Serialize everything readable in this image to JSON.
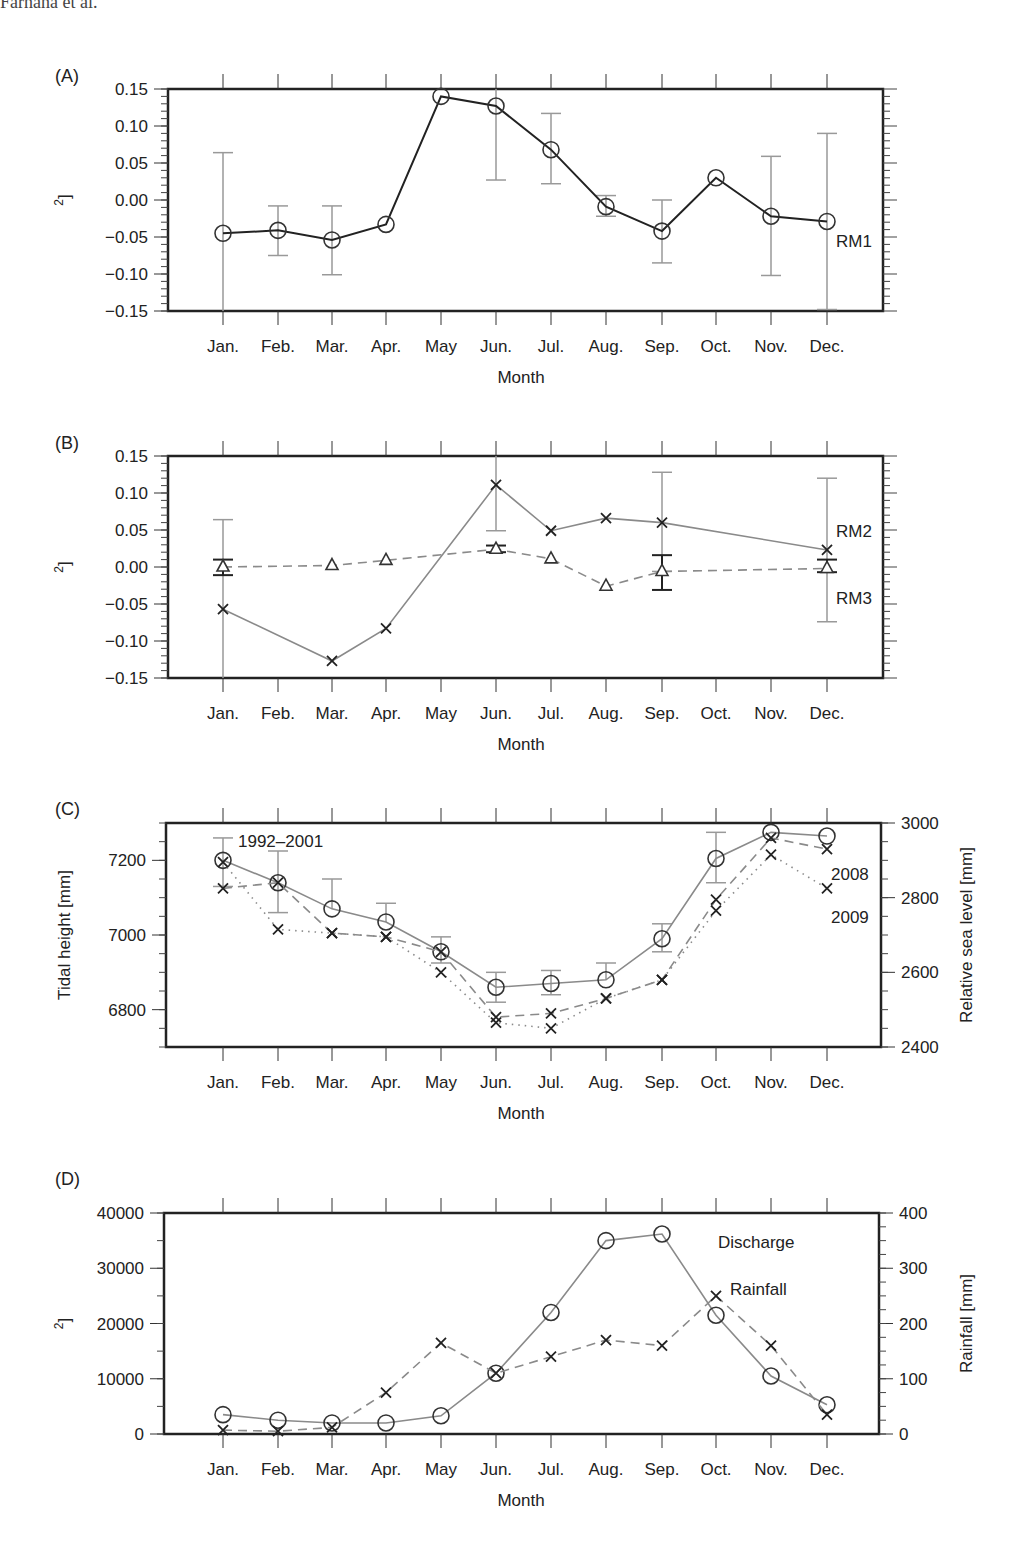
{
  "header": {
    "text": "Farnana et al."
  },
  "months": [
    "Jan.",
    "Feb.",
    "Mar.",
    "Apr.",
    "May",
    "Jun.",
    "Jul.",
    "Aug.",
    "Sep.",
    "Oct.",
    "Nov.",
    "Dec."
  ],
  "chart_data": [
    {
      "panel": "(A)",
      "type": "line",
      "title": "",
      "xlabel": "Month",
      "ylabel": "Area residuals [km²]",
      "ylim": [
        -0.15,
        0.15
      ],
      "yticks": [
        "0.15",
        "0.10",
        "0.05",
        "0.00",
        "−0.05",
        "−0.10",
        "−0.15"
      ],
      "categories": [
        "Jan.",
        "Feb.",
        "Mar.",
        "Apr.",
        "May",
        "Jun.",
        "Jul.",
        "Aug.",
        "Sep.",
        "Oct.",
        "Nov.",
        "Dec."
      ],
      "series": [
        {
          "name": "RM1",
          "marker": "circle",
          "line": "solid-black",
          "values": [
            -0.045,
            -0.041,
            -0.054,
            -0.033,
            0.14,
            0.127,
            0.068,
            -0.009,
            -0.042,
            0.03,
            -0.022,
            -0.029
          ],
          "error_bars": [
            [
              -0.15,
              0.064
            ],
            [
              -0.075,
              -0.008
            ],
            [
              -0.101,
              -0.008
            ],
            null,
            null,
            [
              0.027,
              0.15
            ],
            [
              0.022,
              0.117
            ],
            [
              -0.022,
              0.006
            ],
            [
              -0.085,
              0.0
            ],
            null,
            [
              -0.102,
              0.059
            ],
            [
              -0.148,
              0.09
            ]
          ]
        }
      ],
      "annotations": [
        "RM1"
      ]
    },
    {
      "panel": "(B)",
      "type": "line",
      "xlabel": "Month",
      "ylabel": "Area residuals [km²]",
      "ylim": [
        -0.15,
        0.15
      ],
      "yticks": [
        "0.15",
        "0.10",
        "0.05",
        "0.00",
        "−0.05",
        "−0.10",
        "−0.15"
      ],
      "categories": [
        "Jan.",
        "Feb.",
        "Mar.",
        "Apr.",
        "May",
        "Jun.",
        "Jul.",
        "Aug.",
        "Sep.",
        "Oct.",
        "Nov.",
        "Dec."
      ],
      "series": [
        {
          "name": "RM2",
          "marker": "x",
          "line": "solid-gray",
          "values": [
            -0.057,
            null,
            -0.127,
            -0.083,
            null,
            0.111,
            0.049,
            0.066,
            0.06,
            null,
            null,
            0.023
          ],
          "error_bars": [
            [
              -0.15,
              0.064
            ],
            null,
            null,
            null,
            null,
            [
              0.049,
              0.15
            ],
            null,
            null,
            [
              -0.006,
              0.128
            ],
            null,
            null,
            [
              -0.074,
              0.12
            ]
          ]
        },
        {
          "name": "RM3",
          "marker": "triangle",
          "line": "dashed-gray",
          "values": [
            0.0,
            null,
            0.002,
            0.009,
            null,
            0.024,
            0.011,
            -0.026,
            -0.006,
            null,
            null,
            -0.002
          ],
          "error_bars": [
            [
              -0.011,
              0.01
            ],
            null,
            null,
            null,
            null,
            [
              0.02,
              0.029
            ],
            null,
            null,
            [
              -0.031,
              0.016
            ],
            null,
            null,
            [
              -0.007,
              0.01
            ]
          ]
        }
      ],
      "annotations": [
        "RM2",
        "RM3"
      ]
    },
    {
      "panel": "(C)",
      "type": "line",
      "xlabel": "Month",
      "ylabel": "Tidal height [mm]",
      "ylabel_right": "Relative sea level [mm]",
      "ylim": [
        6700,
        7300
      ],
      "ylim_right": [
        2400,
        3000
      ],
      "yticks": [
        "7200",
        "7000",
        "6800"
      ],
      "yticks_right": [
        "3000",
        "2800",
        "2600",
        "2400"
      ],
      "categories": [
        "Jan.",
        "Feb.",
        "Mar.",
        "Apr.",
        "May",
        "Jun.",
        "Jul.",
        "Aug.",
        "Sep.",
        "Oct.",
        "Nov.",
        "Dec."
      ],
      "series": [
        {
          "name": "1992–2001",
          "axis": "left",
          "marker": "circle",
          "line": "solid-gray",
          "values": [
            7200,
            7140,
            7070,
            7035,
            6955,
            6860,
            6870,
            6880,
            6990,
            7205,
            7275,
            7265
          ],
          "error_bars": [
            [
              7130,
              7260
            ],
            [
              7060,
              7225
            ],
            [
              null,
              7150
            ],
            [
              null,
              7085
            ],
            [
              6925,
              6995
            ],
            [
              6820,
              6900
            ],
            [
              6840,
              6905
            ],
            [
              null,
              6925
            ],
            [
              6955,
              7030
            ],
            [
              7140,
              7275
            ],
            [
              null,
              null
            ],
            [
              null,
              null
            ]
          ]
        },
        {
          "name": "2008",
          "axis": "right",
          "marker": "x",
          "line": "dashed-gray",
          "values": [
            2825,
            2840,
            2705,
            2695,
            2655,
            2480,
            2490,
            2530,
            2580,
            2795,
            2960,
            2930
          ]
        },
        {
          "name": "2009",
          "axis": "right",
          "marker": "x",
          "line": "dotted-gray",
          "values": [
            2895,
            2715,
            2705,
            2695,
            2600,
            2465,
            2450,
            2530,
            2580,
            2765,
            2915,
            2825
          ]
        }
      ],
      "annotations": [
        "1992–2001",
        "2008",
        "2009"
      ]
    },
    {
      "panel": "(D)",
      "type": "line",
      "xlabel": "Month",
      "ylabel": "Water discharge [km²]",
      "ylabel_right": "Rainfall [mm]",
      "ylim": [
        0,
        40000
      ],
      "ylim_right": [
        0,
        400
      ],
      "yticks": [
        "40000",
        "30000",
        "20000",
        "10000",
        "0"
      ],
      "yticks_right": [
        "400",
        "300",
        "200",
        "100",
        "0"
      ],
      "categories": [
        "Jan.",
        "Feb.",
        "Mar.",
        "Apr.",
        "May",
        "Jun.",
        "Jul.",
        "Aug.",
        "Sep.",
        "Oct.",
        "Nov.",
        "Dec."
      ],
      "series": [
        {
          "name": "Discharge",
          "axis": "left",
          "marker": "circle",
          "line": "solid-gray",
          "values": [
            3500,
            2500,
            2000,
            2000,
            3300,
            11000,
            22000,
            35000,
            36200,
            21500,
            10500,
            5300
          ]
        },
        {
          "name": "Rainfall",
          "axis": "right",
          "marker": "x",
          "line": "dashed-gray",
          "values": [
            7,
            5,
            12,
            75,
            165,
            110,
            140,
            170,
            160,
            250,
            160,
            35
          ]
        }
      ],
      "annotations": [
        "Discharge",
        "Rainfall"
      ]
    }
  ]
}
